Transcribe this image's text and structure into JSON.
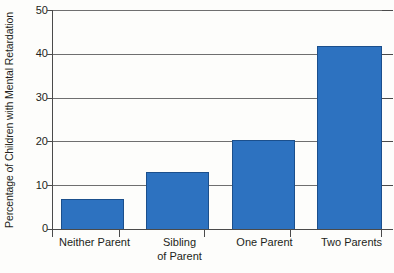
{
  "chart_data": {
    "type": "bar",
    "title": "",
    "subtitle": "",
    "xlabel": "",
    "ylabel": "Percentage of Children with Mental Retardation",
    "categories": [
      "Neither Parent",
      "Sibling\nof Parent",
      "One Parent",
      "Two Parents"
    ],
    "values": [
      6.9,
      13.0,
      20.3,
      41.7
    ],
    "ylim": [
      0,
      50
    ],
    "yticks": [
      0,
      10,
      20,
      30,
      40,
      50
    ],
    "ytick_labels": [
      "0",
      "10",
      "20",
      "30",
      "40",
      "50"
    ],
    "grid": true,
    "legend": null,
    "series": [
      {
        "name": "Percentage of Children with Mental Retardation",
        "values": [
          6.9,
          13.0,
          20.3,
          41.7
        ]
      }
    ],
    "colors": {
      "bar_fill": "#2d72c0",
      "bar_border": "#1b4f8c",
      "gridline": "#6f6f6f",
      "axis": "#4a4a4a",
      "text": "#231f20",
      "background": "#fdfdfb"
    }
  }
}
